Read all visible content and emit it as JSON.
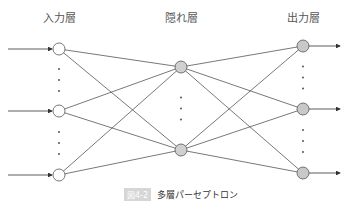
{
  "diagram": {
    "layers": [
      {
        "label": "入力層",
        "x": 59,
        "node_fill": "#ffffff",
        "nodes_y": [
          49,
          111,
          175
        ]
      },
      {
        "label": "隠れ層",
        "x": 181,
        "node_fill": "#d0d0d0",
        "nodes_y": [
          67,
          150
        ]
      },
      {
        "label": "出力層",
        "x": 303,
        "node_fill": "#c8c8c8",
        "nodes_y": [
          46,
          109,
          173
        ]
      }
    ],
    "node_radius": 6,
    "line_color": "#555555",
    "ellipsis": "⋮"
  },
  "caption": {
    "figure_label": "図4-2",
    "text": "多層パーセプトロン"
  }
}
